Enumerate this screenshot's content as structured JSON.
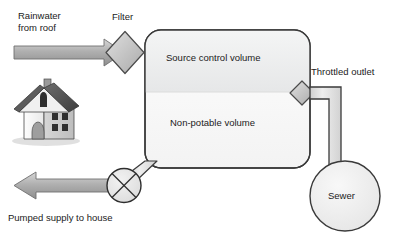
{
  "diagram": {
    "background_color": "#ffffff",
    "labels": {
      "rainwater_from_roof": "Rainwater\nfrom roof",
      "filter": "Filter",
      "source_control_volume": "Source control volume",
      "non_potable_volume": "Non-potable volume",
      "throttled_outlet": "Throttled outlet",
      "sewer": "Sewer",
      "pumped_supply_to_house": "Pumped supply to house"
    },
    "components": [
      {
        "name": "house-icon",
        "kind": "icon",
        "label": ""
      },
      {
        "name": "inlet-arrow",
        "kind": "arrow",
        "direction": "right",
        "label": "Rainwater from roof"
      },
      {
        "name": "filter-valve",
        "kind": "diamond",
        "label": "Filter"
      },
      {
        "name": "storage-tank",
        "kind": "rounded-rect",
        "label": ""
      },
      {
        "name": "source-control-volume",
        "kind": "tank-section",
        "label": "Source control volume"
      },
      {
        "name": "non-potable-volume",
        "kind": "tank-section",
        "label": "Non-potable volume"
      },
      {
        "name": "throttled-outlet-valve",
        "kind": "diamond",
        "label": "Throttled outlet"
      },
      {
        "name": "sewer-node",
        "kind": "circle",
        "label": "Sewer"
      },
      {
        "name": "pump",
        "kind": "circle-cross",
        "label": ""
      },
      {
        "name": "outlet-arrow",
        "kind": "arrow",
        "direction": "left",
        "label": "Pumped supply to house"
      },
      {
        "name": "outlet-pipe",
        "kind": "pipe",
        "label": ""
      },
      {
        "name": "pump-connector-pipe",
        "kind": "pipe",
        "label": ""
      }
    ],
    "colors": {
      "outline": "#3a3a3a",
      "arrow_fill": "#b5b5b5",
      "valve_fill": "#c4c4c4",
      "tank_upper_fill": "#eceded",
      "tank_lower_fill": "#fafafa",
      "sewer_fill": "#efefef",
      "pipe_fill": "#e2e2e2",
      "text": "#1b1b1b"
    }
  }
}
